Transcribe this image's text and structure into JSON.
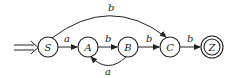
{
  "diagram": {
    "type": "finite-automaton",
    "start_state": "S",
    "states": [
      {
        "id": "S",
        "label": "S",
        "accepting": false
      },
      {
        "id": "A",
        "label": "A",
        "accepting": false
      },
      {
        "id": "B",
        "label": "B",
        "accepting": false
      },
      {
        "id": "C",
        "label": "C",
        "accepting": false
      },
      {
        "id": "Z",
        "label": "Z",
        "accepting": true
      }
    ],
    "transitions": [
      {
        "from": "S",
        "to": "A",
        "label": "a"
      },
      {
        "from": "A",
        "to": "B",
        "label": "b"
      },
      {
        "from": "B",
        "to": "C",
        "label": "b"
      },
      {
        "from": "C",
        "to": "Z",
        "label": "b"
      },
      {
        "from": "B",
        "to": "A",
        "label": "a"
      },
      {
        "from": "S",
        "to": "C",
        "label": "b"
      }
    ],
    "colors": {
      "stroke": "#222222",
      "background": "#ffffff"
    }
  }
}
